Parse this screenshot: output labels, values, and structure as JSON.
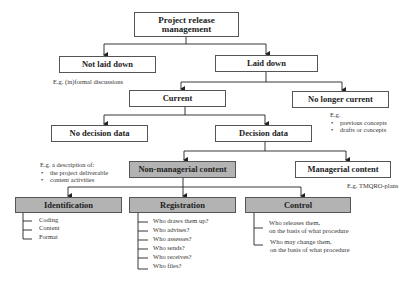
{
  "diagram": {
    "root": "Project release management",
    "level1": {
      "left": "Not laid down",
      "left_note": "E.g. (in)formal discussions",
      "right": "Laid down"
    },
    "level2": {
      "left": "Current",
      "right": "No longer current",
      "right_note": {
        "intro": "E.g.",
        "items": [
          "previous concepts",
          "drafts or concepts"
        ]
      }
    },
    "level3": {
      "left": "No decision data",
      "right": "Decision data"
    },
    "level4": {
      "left": "Non-managerial content",
      "left_note": {
        "intro": "E.g. a description of:",
        "items": [
          "the project deliverable",
          "content activities"
        ]
      },
      "right": "Managerial content",
      "right_note": "E.g. TMQRO-plans"
    },
    "level5": {
      "identification": {
        "title": "Identification",
        "items": [
          "Coding",
          "Content",
          "Format"
        ]
      },
      "registration": {
        "title": "Registration",
        "items": [
          "Who draws them up?",
          "Who advises?",
          "Who assesses?",
          "Who sends?",
          "Who receives?",
          "Who files?"
        ]
      },
      "control": {
        "title": "Control",
        "items": [
          [
            "Who releases them,",
            "on the basis of what procedure"
          ],
          [
            "Who may change them,",
            "on the basis of what procedure"
          ]
        ]
      }
    }
  },
  "colors": {
    "highlight_fill": "#b3b3b3",
    "border": "#555555",
    "line": "#222222"
  }
}
